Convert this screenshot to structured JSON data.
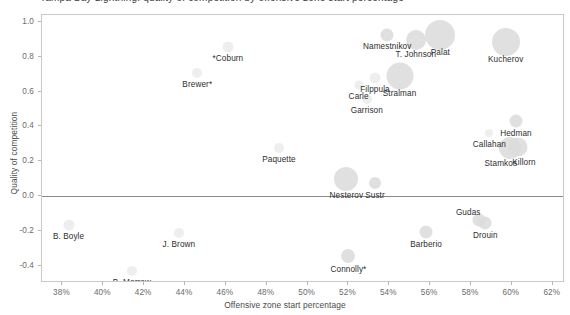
{
  "chart_data": {
    "type": "scatter",
    "title": "Tampa Bay Lightning: quality of competition by offensive zone start percentage",
    "xlabel": "Offensive zone start percentage",
    "ylabel": "Quality of competition",
    "xlim": [
      37.0,
      62.6
    ],
    "ylim": [
      -0.5,
      1.04
    ],
    "xticks": [
      "38%",
      "40%",
      "42%",
      "44%",
      "46%",
      "48%",
      "50%",
      "52%",
      "54%",
      "56%",
      "58%",
      "60%",
      "62%"
    ],
    "xtick_values": [
      38,
      40,
      42,
      44,
      46,
      48,
      50,
      52,
      54,
      56,
      58,
      60,
      62
    ],
    "yticks": [
      "1.0",
      "0.8",
      "0.6",
      "0.4",
      "0.2",
      "0.0",
      "-0.2",
      "-0.4"
    ],
    "ytick_values": [
      1.0,
      0.8,
      0.6,
      0.4,
      0.2,
      0.0,
      -0.2,
      -0.4
    ],
    "grid": false,
    "legend": "none",
    "reference_line_y": 0.0,
    "bubble_encoding": "time on ice",
    "bubble_color": "#d8d8d8",
    "points": [
      {
        "label": "*Coburn",
        "x": 46.1,
        "y": 0.855,
        "size": 11,
        "label_dx": 0,
        "label_dy": 7
      },
      {
        "label": "Brewer*",
        "x": 44.6,
        "y": 0.705,
        "size": 10,
        "label_dx": 0,
        "label_dy": 7
      },
      {
        "label": "Namestnikov",
        "x": 53.9,
        "y": 0.925,
        "size": 13,
        "label_dx": 0,
        "label_dy": 7
      },
      {
        "label": "T. Johnson",
        "x": 55.3,
        "y": 0.895,
        "size": 20,
        "label_dx": 0,
        "label_dy": 10
      },
      {
        "label": "Palat",
        "x": 56.5,
        "y": 0.925,
        "size": 30,
        "label_dx": 0,
        "label_dy": 13
      },
      {
        "label": "Kucherov",
        "x": 59.7,
        "y": 0.885,
        "size": 28,
        "label_dx": 0,
        "label_dy": 13
      },
      {
        "label": "Filppula",
        "x": 53.3,
        "y": 0.68,
        "size": 11,
        "label_dx": 0,
        "label_dy": 7
      },
      {
        "label": "Carle",
        "x": 52.5,
        "y": 0.64,
        "size": 9,
        "label_dx": 0,
        "label_dy": 7
      },
      {
        "label": "Stralman",
        "x": 54.5,
        "y": 0.69,
        "size": 27,
        "label_dx": 0,
        "label_dy": 13
      },
      {
        "label": "Garrison",
        "x": 52.9,
        "y": 0.555,
        "size": 10,
        "label_dx": 0,
        "label_dy": 7
      },
      {
        "label": "Hedman",
        "x": 60.2,
        "y": 0.43,
        "size": 13,
        "label_dx": 0,
        "label_dy": 8
      },
      {
        "label": "Callahan",
        "x": 58.9,
        "y": 0.36,
        "size": 8,
        "label_dx": 0,
        "label_dy": 7
      },
      {
        "label": "Stamkos",
        "x": 59.9,
        "y": 0.275,
        "size": 22,
        "label_dx": -9,
        "label_dy": 11
      },
      {
        "label": "Killorn",
        "x": 60.3,
        "y": 0.28,
        "size": 19,
        "label_dx": 6,
        "label_dy": 11
      },
      {
        "label": "Paquette",
        "x": 48.6,
        "y": 0.275,
        "size": 10,
        "label_dx": 0,
        "label_dy": 7
      },
      {
        "label": "Nesterov",
        "x": 51.9,
        "y": 0.1,
        "size": 24,
        "label_dx": 0,
        "label_dy": 12
      },
      {
        "label": "Sustr",
        "x": 53.3,
        "y": 0.075,
        "size": 12,
        "label_dx": 0,
        "label_dy": 8
      },
      {
        "label": "Gudas",
        "x": 58.4,
        "y": -0.14,
        "size": 13,
        "label_dx": -11,
        "label_dy": -12
      },
      {
        "label": "Drouin",
        "x": 58.7,
        "y": -0.155,
        "size": 13,
        "label_dx": 0,
        "label_dy": 8
      },
      {
        "label": "Barberio",
        "x": 55.8,
        "y": -0.205,
        "size": 13,
        "label_dx": 0,
        "label_dy": 8
      },
      {
        "label": "B. Boyle",
        "x": 38.3,
        "y": -0.165,
        "size": 11,
        "label_dx": 0,
        "label_dy": 7
      },
      {
        "label": "J. Brown",
        "x": 43.7,
        "y": -0.215,
        "size": 10,
        "label_dx": 0,
        "label_dy": 7
      },
      {
        "label": "Connolly*",
        "x": 52.0,
        "y": -0.345,
        "size": 14,
        "label_dx": 0,
        "label_dy": 9
      },
      {
        "label": "B. Morrow",
        "x": 41.4,
        "y": -0.43,
        "size": 10,
        "label_dx": 0,
        "label_dy": 7
      }
    ]
  }
}
